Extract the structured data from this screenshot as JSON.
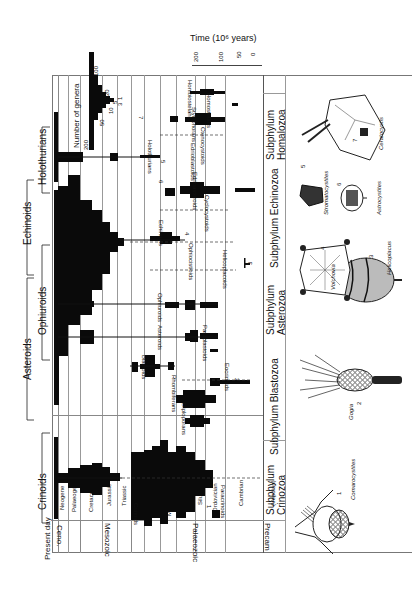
{
  "figure": {
    "orientation": "rotated-90",
    "time_axis": {
      "title": "Time (10⁶ years)",
      "ticks": [
        "200",
        "100",
        "50",
        "0"
      ]
    },
    "genera_scale": {
      "title": "Number of genera",
      "ticks": [
        "200",
        "100",
        "50",
        "20",
        "10",
        "5",
        "3",
        "1"
      ]
    },
    "eras": [
      {
        "label": "Ceno."
      },
      {
        "label": "Mesozoic"
      },
      {
        "label": "Palaeozoic"
      },
      {
        "label": "Precam"
      }
    ],
    "periods": [
      {
        "label": "Present day"
      },
      {
        "label": "Neogene"
      },
      {
        "label": "Palaeogene"
      },
      {
        "label": "Cretaceous"
      },
      {
        "label": "Jurassic"
      },
      {
        "label": "Triassic"
      },
      {
        "label": "Permian"
      },
      {
        "label": "Pennsylvanian"
      },
      {
        "label": "Mississippian"
      },
      {
        "label": "Devonian"
      },
      {
        "label": "Silurian"
      },
      {
        "label": "Ordovician"
      },
      {
        "label": "Cambrian"
      },
      {
        "label": "(Vendian)"
      }
    ],
    "crown_groups": [
      {
        "label": "Crinoids"
      },
      {
        "label": "Asteroids"
      },
      {
        "label": "Ophiuroids"
      },
      {
        "label": "Echinoids"
      },
      {
        "label": "Holothurians"
      }
    ],
    "subphyla": [
      {
        "label": "Subphylum Crinozoa"
      },
      {
        "label": "Subphylum Blastozoa"
      },
      {
        "label": "Subphylum Asterozoa"
      },
      {
        "label": "Subphylum Echinozoa"
      },
      {
        "label": "Subphylum Homalozoa"
      }
    ],
    "taxa": [
      {
        "label": "Paracrinoids"
      },
      {
        "label": "Crinoids"
      },
      {
        "label": "Diploporans"
      },
      {
        "label": "Rhombiferans"
      },
      {
        "label": "Eocrinoids"
      },
      {
        "label": "Blastoids"
      },
      {
        "label": "Parablastoids"
      },
      {
        "label": "Asteroids"
      },
      {
        "label": "Ophiuroids"
      },
      {
        "label": "Helicoplacoids"
      },
      {
        "label": "Ophiocistioids"
      },
      {
        "label": "Echinoids"
      },
      {
        "label": "Cyclocystoids"
      },
      {
        "label": "Edrioasteroids"
      },
      {
        "label": "Edrioblastoids"
      },
      {
        "label": "Holothurians"
      },
      {
        "label": "Ctenocystoids"
      },
      {
        "label": "Stylophorans"
      },
      {
        "label": "Homostelans"
      },
      {
        "label": "Homoiostelans"
      }
    ],
    "illustrations": [
      {
        "number": "1",
        "label": "Comarocystites"
      },
      {
        "number": "2",
        "label": "Gogia"
      },
      {
        "number": "3",
        "label": "Helicoplacus"
      },
      {
        "number": "4",
        "label": "Volchovia"
      },
      {
        "number": "5",
        "label": "Stromatocystites"
      },
      {
        "number": "6",
        "label": "Astrocystites"
      },
      {
        "number": "7",
        "label": "Ceratocystis"
      }
    ],
    "marker_numbers": [
      "1",
      "2",
      "3",
      "4",
      "5",
      "6",
      "7"
    ]
  }
}
